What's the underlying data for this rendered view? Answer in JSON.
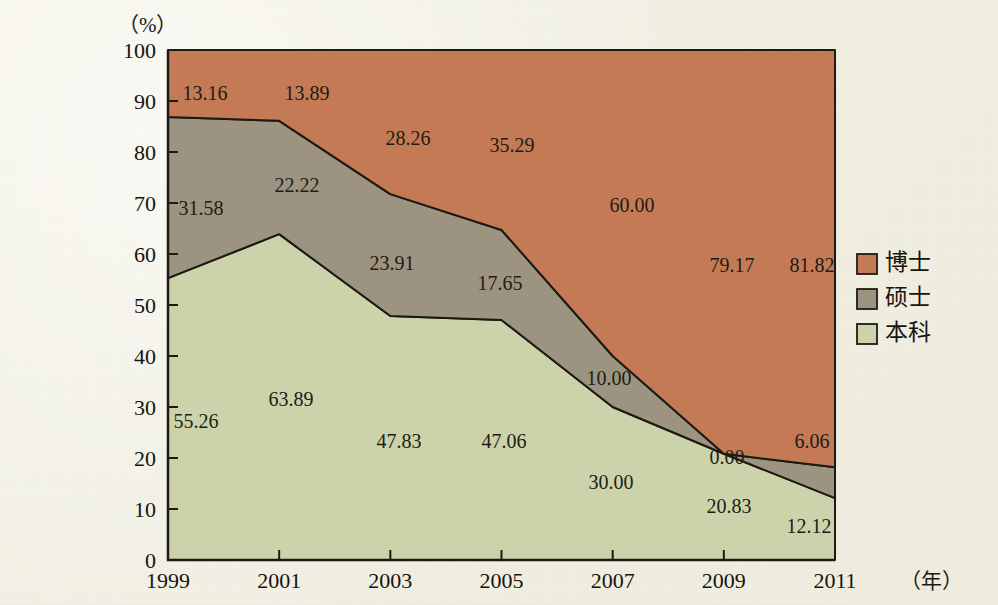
{
  "chart_data": {
    "type": "area",
    "title": "",
    "subtitle": "",
    "xlabel": "年",
    "ylabel": "%",
    "x_unit_label": "（年）",
    "y_unit_label": "（%）",
    "categories": [
      "1999",
      "2001",
      "2003",
      "2005",
      "2007",
      "2009",
      "2011"
    ],
    "x": [
      1999,
      2001,
      2003,
      2005,
      2007,
      2009,
      2011
    ],
    "stacked": true,
    "stack_total": 100,
    "ylim": [
      0,
      100
    ],
    "xlim": [
      1999,
      2011
    ],
    "yticks": [
      0,
      10,
      20,
      30,
      40,
      50,
      60,
      70,
      80,
      90,
      100
    ],
    "ytick_labels": [
      "0",
      "10",
      "20",
      "30",
      "40",
      "50",
      "60",
      "70",
      "80",
      "90",
      "100"
    ],
    "xticks": [
      1999,
      2001,
      2003,
      2005,
      2007,
      2009,
      2011
    ],
    "xtick_labels": [
      "1999",
      "2001",
      "2003",
      "2005",
      "2007",
      "2009",
      "2011"
    ],
    "grid": false,
    "legend_position": "right",
    "stack_order_bottom_to_top": [
      "本科",
      "硕士",
      "博士"
    ],
    "series": [
      {
        "name": "博士",
        "color": "#c57a56",
        "values": [
          13.16,
          13.89,
          28.26,
          35.29,
          60.0,
          79.17,
          81.82
        ],
        "labels": [
          "13.16",
          "13.89",
          "28.26",
          "35.29",
          "60.00",
          "79.17",
          "81.82"
        ]
      },
      {
        "name": "硕士",
        "color": "#9c9381",
        "values": [
          31.58,
          22.22,
          23.91,
          17.65,
          10.0,
          0.0,
          6.06
        ],
        "labels": [
          "31.58",
          "22.22",
          "23.91",
          "17.65",
          "10.00",
          "0.00",
          "6.06"
        ]
      },
      {
        "name": "本科",
        "color": "#ccd3ab",
        "values": [
          55.26,
          63.89,
          47.83,
          47.06,
          30.0,
          20.83,
          12.12
        ],
        "labels": [
          "55.26",
          "63.89",
          "47.83",
          "47.06",
          "30.00",
          "20.83",
          "12.12"
        ]
      }
    ],
    "legend_entries": [
      {
        "label": "博士",
        "color": "#c57a56"
      },
      {
        "label": "硕士",
        "color": "#9c9381"
      },
      {
        "label": "本科",
        "color": "#ccd3ab"
      }
    ],
    "value_label_positions": [
      {
        "series": "博士",
        "category": "1999",
        "text": "13.16",
        "x": 205,
        "y": 100
      },
      {
        "series": "博士",
        "category": "2001",
        "text": "13.89",
        "x": 307,
        "y": 100
      },
      {
        "series": "博士",
        "category": "2003",
        "text": "28.26",
        "x": 408,
        "y": 145
      },
      {
        "series": "博士",
        "category": "2005",
        "text": "35.29",
        "x": 512,
        "y": 152
      },
      {
        "series": "博士",
        "category": "2007",
        "text": "60.00",
        "x": 632,
        "y": 212
      },
      {
        "series": "博士",
        "category": "2009",
        "text": "79.17",
        "x": 732,
        "y": 272
      },
      {
        "series": "博士",
        "category": "2011",
        "text": "81.82",
        "x": 812,
        "y": 272
      },
      {
        "series": "硕士",
        "category": "1999",
        "text": "31.58",
        "x": 201,
        "y": 215
      },
      {
        "series": "硕士",
        "category": "2001",
        "text": "22.22",
        "x": 297,
        "y": 192
      },
      {
        "series": "硕士",
        "category": "2003",
        "text": "23.91",
        "x": 392,
        "y": 270
      },
      {
        "series": "硕士",
        "category": "2005",
        "text": "17.65",
        "x": 500,
        "y": 290
      },
      {
        "series": "硕士",
        "category": "2007",
        "text": "10.00",
        "x": 609,
        "y": 385
      },
      {
        "series": "硕士",
        "category": "2009",
        "text": "0.00",
        "x": 727,
        "y": 464
      },
      {
        "series": "硕士",
        "category": "2011",
        "text": "6.06",
        "x": 812,
        "y": 448
      },
      {
        "series": "本科",
        "category": "1999",
        "text": "55.26",
        "x": 196,
        "y": 428
      },
      {
        "series": "本科",
        "category": "2001",
        "text": "63.89",
        "x": 291,
        "y": 406
      },
      {
        "series": "本科",
        "category": "2003",
        "text": "47.83",
        "x": 399,
        "y": 448
      },
      {
        "series": "本科",
        "category": "2005",
        "text": "47.06",
        "x": 504,
        "y": 448
      },
      {
        "series": "本科",
        "category": "2007",
        "text": "30.00",
        "x": 611,
        "y": 489
      },
      {
        "series": "本科",
        "category": "2009",
        "text": "20.83",
        "x": 729,
        "y": 513
      },
      {
        "series": "本科",
        "category": "2011",
        "text": "12.12",
        "x": 809,
        "y": 533
      }
    ]
  },
  "colors": {
    "doctorate": "#c57a56",
    "master": "#9c9381",
    "bachelor": "#ccd3ab",
    "axis": "#1d1a13",
    "text": "#15140f",
    "paper": "#f4f2e6"
  }
}
